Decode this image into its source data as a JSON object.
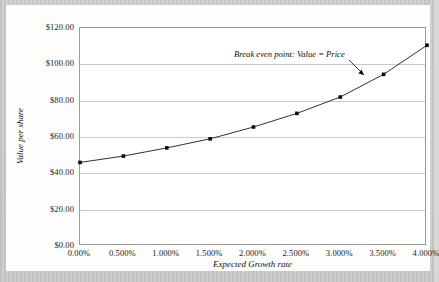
{
  "chart_data": {
    "type": "line",
    "title": "",
    "xlabel": "Expected Growth rate",
    "ylabel": "Value per share",
    "x": [
      0.0,
      0.5,
      1.0,
      1.5,
      2.0,
      2.5,
      3.0,
      3.5,
      4.0
    ],
    "categories": [
      "0.00%",
      "0.500%",
      "1.000%",
      "1.500%",
      "2.000%",
      "2.500%",
      "3.000%",
      "3.500%",
      "4.000%"
    ],
    "values": [
      46.0,
      49.5,
      54.0,
      59.0,
      65.5,
      73.0,
      82.0,
      94.5,
      110.5
    ],
    "series": [
      {
        "name": "Value per share",
        "values": [
          46.0,
          49.5,
          54.0,
          59.0,
          65.5,
          73.0,
          82.0,
          94.5,
          110.5
        ]
      }
    ],
    "ylim": [
      0,
      120
    ],
    "xlim": [
      0.0,
      4.0
    ],
    "ytick_labels": [
      "$120.00",
      "$100.00",
      "$80.00",
      "$60.00",
      "$40.00",
      "$20.00",
      "$0.00"
    ],
    "ytick_values": [
      120,
      100,
      80,
      60,
      40,
      20,
      0
    ],
    "xtick_labels": [
      "0.00%",
      "0.500%",
      "1.000%",
      "1.500%",
      "2.000%",
      "2.500%",
      "3.000%",
      "3.500%",
      "4.000%"
    ],
    "grid": "horizontal",
    "legend": "none",
    "marker": "square",
    "line_color": "#1a1a1a",
    "marker_color": "#0a0a0a",
    "gridline_color": "#c9c9c9",
    "plot_background": "#ffffff",
    "annotations": [
      {
        "text": "Break even point: Value = Price",
        "points_to_x": 3.5,
        "points_to_y": 94.5
      }
    ]
  },
  "axes": {
    "y_title": "Value per share",
    "x_title": "Expected Growth rate"
  },
  "annotation": {
    "label": "Break even point: Value = Price"
  }
}
